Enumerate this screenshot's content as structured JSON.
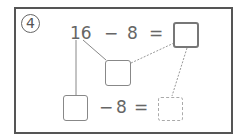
{
  "problem": {
    "number": "4",
    "number_glyph": "④",
    "top_equation": {
      "minuend": "16",
      "operator": "−",
      "subtrahend": "8",
      "equals": "=",
      "answer": ""
    },
    "decomposition": {
      "part_box": "",
      "remaining_box": ""
    },
    "bottom_equation": {
      "operator": "−",
      "subtrahend": "8",
      "equals": "=",
      "answer": ""
    }
  },
  "colors": {
    "border": "#555555",
    "text": "#666666",
    "dashed": "#aaaaaa"
  }
}
